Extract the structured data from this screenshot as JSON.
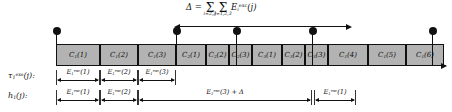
{
  "figure": {
    "caption_formula": {
      "lhs": "Δ",
      "equals": "=",
      "sum1_symbol": "Σ",
      "sum1_limits": "i=2,3",
      "sum2_symbol": "Σ",
      "sum2_limits": "j=1,2,3",
      "term_base": "E",
      "term_sub": "i",
      "term_sup": "exc",
      "term_arg": "(j)"
    },
    "timeline": {
      "blocks": [
        {
          "base": "C",
          "sub": "1",
          "arg": "(1)",
          "width": 44
        },
        {
          "base": "C",
          "sub": "1",
          "arg": "(2)",
          "width": 38
        },
        {
          "base": "C",
          "sub": "1",
          "arg": "(3)",
          "width": 38
        },
        {
          "base": "C",
          "sub": "2",
          "arg": "(1)",
          "width": 30
        },
        {
          "base": "C",
          "sub": "2",
          "arg": "(2)",
          "width": 23
        },
        {
          "base": "C",
          "sub": "2",
          "arg": "(3)",
          "width": 23
        },
        {
          "base": "C",
          "sub": "3",
          "arg": "(1)",
          "width": 30
        },
        {
          "base": "C",
          "sub": "3",
          "arg": "(2)",
          "width": 23
        },
        {
          "base": "C",
          "sub": "3",
          "arg": "(3)",
          "width": 23
        },
        {
          "base": "C",
          "sub": "1",
          "arg": "(4)",
          "width": 40
        },
        {
          "base": "C",
          "sub": "1",
          "arg": "(5)",
          "width": 38
        },
        {
          "base": "C",
          "sub": "1",
          "arg": "(6)",
          "width": 38
        }
      ],
      "release_pins": [
        {
          "x": 56
        },
        {
          "x": 176
        },
        {
          "x": 236
        },
        {
          "x": 312
        },
        {
          "x": 432
        }
      ]
    },
    "rows": [
      {
        "label_base": "τ",
        "label_sub": "1",
        "label_sup": "exe",
        "label_arg": "(j):",
        "measures": [
          {
            "left": 56,
            "width": 44,
            "base": "E",
            "sub": "1",
            "sup": "exc",
            "arg": "(1)"
          },
          {
            "left": 100,
            "width": 38,
            "base": "E",
            "sub": "1",
            "sup": "exc",
            "arg": "(2)"
          },
          {
            "left": 138,
            "width": 38,
            "base": "E",
            "sub": "1",
            "sup": "exc",
            "arg": "(3)"
          }
        ]
      },
      {
        "label_base": "h",
        "label_sub": "1",
        "label_sup": "",
        "label_arg": "(j):",
        "measures": [
          {
            "left": 56,
            "width": 44,
            "base": "E",
            "sub": "1",
            "sup": "exc",
            "arg": "(1)"
          },
          {
            "left": 100,
            "width": 38,
            "base": "E",
            "sub": "1",
            "sup": "exc",
            "arg": "(2)"
          },
          {
            "left": 138,
            "width": 174,
            "base": "E",
            "sub": "1",
            "sup": "exc",
            "arg": "(3) + Δ"
          },
          {
            "left": 314,
            "width": 42,
            "base": "E",
            "sub": "1",
            "sup": "exc",
            "arg": "(1)"
          }
        ]
      }
    ],
    "colors": {
      "block_fill": "#b3b3b3",
      "stroke": "#111111",
      "background": "#ffffff"
    }
  }
}
